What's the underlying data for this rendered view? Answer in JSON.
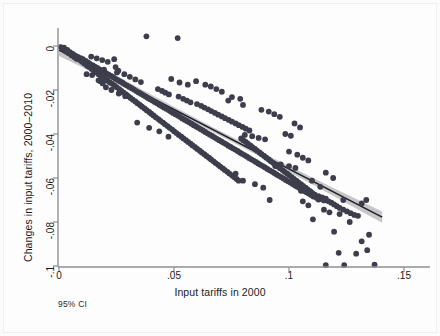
{
  "chart_data": {
    "type": "scatter",
    "title": "",
    "xlabel": "Input tariffs in 2000",
    "ylabel": "Changes in input tariffs, 2000–2010",
    "note": "95% CI",
    "grid": false,
    "legend": "none",
    "xlim": [
      0,
      0.155
    ],
    "ylim": [
      -0.1,
      0.006
    ],
    "xticks": [
      0,
      0.05,
      0.1,
      0.15
    ],
    "xticklabels": [
      "0",
      ".05",
      ".1",
      ".15"
    ],
    "yticks": [
      0,
      -0.02,
      -0.04,
      -0.06,
      -0.08,
      -0.1
    ],
    "yticklabels": [
      "0",
      "-.02",
      "-.04",
      "-.06",
      "-.08",
      "-.1"
    ],
    "marker_color": "#3d3d4c",
    "fit_line_color": "#20202c",
    "ci_band_color": "#bdbdbd",
    "axis_color": "#8f8f8f",
    "fit_line": {
      "x_start": 0.0,
      "y_start": -0.0018,
      "x_end": 0.1405,
      "y_end": -0.0778,
      "slope": -0.5409,
      "intercept": -0.0018
    },
    "ci_band": {
      "half_width_at_x_start": 0.0028,
      "half_width_at_x_mid": 0.0011,
      "half_width_at_x_end": 0.0026
    },
    "points": [
      [
        0.0008,
        -0.0005
      ],
      [
        0.0015,
        -0.0012
      ],
      [
        0.0022,
        -0.0008
      ],
      [
        0.003,
        -0.0025
      ],
      [
        0.0036,
        -0.0018
      ],
      [
        0.0042,
        -0.0033
      ],
      [
        0.0048,
        -0.0028
      ],
      [
        0.0054,
        -0.0042
      ],
      [
        0.006,
        -0.0036
      ],
      [
        0.0066,
        -0.005
      ],
      [
        0.0071,
        -0.0044
      ],
      [
        0.0076,
        -0.0058
      ],
      [
        0.0082,
        -0.0049
      ],
      [
        0.0088,
        -0.0063
      ],
      [
        0.0094,
        -0.0055
      ],
      [
        0.01,
        -0.0072
      ],
      [
        0.0104,
        -0.006
      ],
      [
        0.011,
        -0.008
      ],
      [
        0.0116,
        -0.0068
      ],
      [
        0.0122,
        -0.009
      ],
      [
        0.0126,
        -0.0074
      ],
      [
        0.0131,
        -0.0096
      ],
      [
        0.0136,
        -0.0082
      ],
      [
        0.0142,
        -0.0104
      ],
      [
        0.0147,
        -0.0088
      ],
      [
        0.0152,
        -0.0112
      ],
      [
        0.0156,
        -0.0094
      ],
      [
        0.0161,
        -0.012
      ],
      [
        0.0166,
        -0.01
      ],
      [
        0.0172,
        -0.0128
      ],
      [
        0.0176,
        -0.0106
      ],
      [
        0.0182,
        -0.0136
      ],
      [
        0.0186,
        -0.0112
      ],
      [
        0.0192,
        -0.0144
      ],
      [
        0.0196,
        -0.0118
      ],
      [
        0.0202,
        -0.015
      ],
      [
        0.0206,
        -0.0124
      ],
      [
        0.0211,
        -0.0158
      ],
      [
        0.0216,
        -0.013
      ],
      [
        0.0221,
        -0.0166
      ],
      [
        0.0172,
        -0.0156
      ],
      [
        0.018,
        -0.016
      ],
      [
        0.019,
        -0.017
      ],
      [
        0.02,
        -0.0152
      ],
      [
        0.0226,
        -0.0136
      ],
      [
        0.0231,
        -0.0172
      ],
      [
        0.0236,
        -0.0142
      ],
      [
        0.0242,
        -0.018
      ],
      [
        0.0246,
        -0.0149
      ],
      [
        0.0251,
        -0.0188
      ],
      [
        0.0256,
        -0.0155
      ],
      [
        0.0262,
        -0.0196
      ],
      [
        0.0266,
        -0.0161
      ],
      [
        0.0271,
        -0.0204
      ],
      [
        0.0276,
        -0.0167
      ],
      [
        0.0281,
        -0.0212
      ],
      [
        0.0286,
        -0.0174
      ],
      [
        0.0292,
        -0.022
      ],
      [
        0.0296,
        -0.018
      ],
      [
        0.0301,
        -0.0228
      ],
      [
        0.024,
        -0.006
      ],
      [
        0.0246,
        -0.0096
      ],
      [
        0.0252,
        -0.012
      ],
      [
        0.0258,
        -0.0112
      ],
      [
        0.0306,
        -0.0186
      ],
      [
        0.0311,
        -0.0236
      ],
      [
        0.0316,
        -0.0192
      ],
      [
        0.0321,
        -0.0244
      ],
      [
        0.0326,
        -0.0198
      ],
      [
        0.0332,
        -0.0252
      ],
      [
        0.0336,
        -0.0205
      ],
      [
        0.0341,
        -0.026
      ],
      [
        0.0346,
        -0.0211
      ],
      [
        0.0352,
        -0.0268
      ],
      [
        0.0356,
        -0.0217
      ],
      [
        0.0361,
        -0.0276
      ],
      [
        0.0366,
        -0.0223
      ],
      [
        0.0372,
        -0.0284
      ],
      [
        0.0376,
        -0.0229
      ],
      [
        0.0381,
        -0.0292
      ],
      [
        0.0386,
        -0.0236
      ],
      [
        0.0392,
        -0.03
      ],
      [
        0.0396,
        -0.0242
      ],
      [
        0.0401,
        -0.0308
      ],
      [
        0.038,
        0.0044
      ],
      [
        0.0516,
        0.0036
      ],
      [
        0.034,
        -0.0348
      ],
      [
        0.0392,
        -0.0372
      ],
      [
        0.0436,
        -0.0388
      ],
      [
        0.0476,
        -0.0412
      ],
      [
        0.0406,
        -0.0248
      ],
      [
        0.0411,
        -0.0316
      ],
      [
        0.0416,
        -0.0254
      ],
      [
        0.0421,
        -0.0324
      ],
      [
        0.0426,
        -0.026
      ],
      [
        0.0432,
        -0.0332
      ],
      [
        0.0436,
        -0.0267
      ],
      [
        0.0441,
        -0.034
      ],
      [
        0.0446,
        -0.0273
      ],
      [
        0.0452,
        -0.0348
      ],
      [
        0.0456,
        -0.0279
      ],
      [
        0.0461,
        -0.0356
      ],
      [
        0.0466,
        -0.0285
      ],
      [
        0.0472,
        -0.0364
      ],
      [
        0.0476,
        -0.0291
      ],
      [
        0.0481,
        -0.0372
      ],
      [
        0.0486,
        -0.0298
      ],
      [
        0.0492,
        -0.038
      ],
      [
        0.0496,
        -0.0304
      ],
      [
        0.0501,
        -0.0388
      ],
      [
        0.043,
        -0.0196
      ],
      [
        0.0448,
        -0.0204
      ],
      [
        0.0462,
        -0.0212
      ],
      [
        0.0478,
        -0.022
      ],
      [
        0.0506,
        -0.031
      ],
      [
        0.0511,
        -0.0396
      ],
      [
        0.0516,
        -0.0316
      ],
      [
        0.0521,
        -0.0404
      ],
      [
        0.0526,
        -0.0322
      ],
      [
        0.0532,
        -0.0412
      ],
      [
        0.0536,
        -0.0329
      ],
      [
        0.0541,
        -0.042
      ],
      [
        0.0546,
        -0.0335
      ],
      [
        0.0552,
        -0.0428
      ],
      [
        0.0556,
        -0.0341
      ],
      [
        0.0561,
        -0.0436
      ],
      [
        0.0566,
        -0.0347
      ],
      [
        0.0572,
        -0.0444
      ],
      [
        0.0576,
        -0.0353
      ],
      [
        0.0581,
        -0.0452
      ],
      [
        0.052,
        -0.023
      ],
      [
        0.054,
        -0.024
      ],
      [
        0.0556,
        -0.0248
      ],
      [
        0.0572,
        -0.0256
      ],
      [
        0.0586,
        -0.036
      ],
      [
        0.0592,
        -0.046
      ],
      [
        0.0596,
        -0.0366
      ],
      [
        0.0601,
        -0.0468
      ],
      [
        0.0606,
        -0.0372
      ],
      [
        0.0612,
        -0.0476
      ],
      [
        0.0616,
        -0.0378
      ],
      [
        0.0621,
        -0.0484
      ],
      [
        0.0626,
        -0.0384
      ],
      [
        0.0632,
        -0.0492
      ],
      [
        0.0636,
        -0.0391
      ],
      [
        0.0641,
        -0.05
      ],
      [
        0.06,
        -0.0264
      ],
      [
        0.0618,
        -0.0272
      ],
      [
        0.0632,
        -0.028
      ],
      [
        0.0648,
        -0.0288
      ],
      [
        0.0646,
        -0.0397
      ],
      [
        0.0652,
        -0.0508
      ],
      [
        0.0656,
        -0.0403
      ],
      [
        0.0661,
        -0.0516
      ],
      [
        0.0666,
        -0.0409
      ],
      [
        0.0672,
        -0.0524
      ],
      [
        0.0676,
        -0.0415
      ],
      [
        0.0681,
        -0.0532
      ],
      [
        0.0686,
        -0.0422
      ],
      [
        0.0692,
        -0.054
      ],
      [
        0.0696,
        -0.0428
      ],
      [
        0.0701,
        -0.0548
      ],
      [
        0.0662,
        -0.0296
      ],
      [
        0.0678,
        -0.0304
      ],
      [
        0.0692,
        -0.0312
      ],
      [
        0.0708,
        -0.032
      ],
      [
        0.0706,
        -0.0434
      ],
      [
        0.0712,
        -0.0556
      ],
      [
        0.0716,
        -0.044
      ],
      [
        0.0721,
        -0.0564
      ],
      [
        0.0726,
        -0.0446
      ],
      [
        0.0732,
        -0.0572
      ],
      [
        0.0736,
        -0.0453
      ],
      [
        0.0741,
        -0.058
      ],
      [
        0.0722,
        -0.0328
      ],
      [
        0.0738,
        -0.0336
      ],
      [
        0.0752,
        -0.0344
      ],
      [
        0.0768,
        -0.0352
      ],
      [
        0.0746,
        -0.0459
      ],
      [
        0.0752,
        -0.0588
      ],
      [
        0.0756,
        -0.0465
      ],
      [
        0.0761,
        -0.0596
      ],
      [
        0.0766,
        -0.0471
      ],
      [
        0.0772,
        -0.0604
      ],
      [
        0.0776,
        -0.0477
      ],
      [
        0.0781,
        -0.0612
      ],
      [
        0.0782,
        -0.036
      ],
      [
        0.0798,
        -0.0368
      ],
      [
        0.0812,
        -0.0376
      ],
      [
        0.0828,
        -0.0384
      ],
      [
        0.0786,
        -0.0484
      ],
      [
        0.0792,
        -0.042
      ],
      [
        0.0796,
        -0.049
      ],
      [
        0.0801,
        -0.0428
      ],
      [
        0.0806,
        -0.0496
      ],
      [
        0.0812,
        -0.0436
      ],
      [
        0.0816,
        -0.0502
      ],
      [
        0.0821,
        -0.0444
      ],
      [
        0.0826,
        -0.0509
      ],
      [
        0.0832,
        -0.0452
      ],
      [
        0.0836,
        -0.0515
      ],
      [
        0.0841,
        -0.046
      ],
      [
        0.0846,
        -0.0521
      ],
      [
        0.0852,
        -0.0468
      ],
      [
        0.0856,
        -0.0527
      ],
      [
        0.0861,
        -0.0476
      ],
      [
        0.0866,
        -0.0534
      ],
      [
        0.0872,
        -0.0484
      ],
      [
        0.0876,
        -0.054
      ],
      [
        0.0881,
        -0.0492
      ],
      [
        0.0886,
        -0.0546
      ],
      [
        0.0892,
        -0.05
      ],
      [
        0.0896,
        -0.0552
      ],
      [
        0.0901,
        -0.0508
      ],
      [
        0.0906,
        -0.0559
      ],
      [
        0.0912,
        -0.0516
      ],
      [
        0.0916,
        -0.0565
      ],
      [
        0.0921,
        -0.0524
      ],
      [
        0.0926,
        -0.0571
      ],
      [
        0.0932,
        -0.0532
      ],
      [
        0.0936,
        -0.0577
      ],
      [
        0.0941,
        -0.054
      ],
      [
        0.0946,
        -0.0584
      ],
      [
        0.0952,
        -0.0548
      ],
      [
        0.0956,
        -0.059
      ],
      [
        0.0961,
        -0.0556
      ],
      [
        0.0966,
        -0.0596
      ],
      [
        0.0972,
        -0.0564
      ],
      [
        0.0976,
        -0.0602
      ],
      [
        0.0981,
        -0.0572
      ],
      [
        0.0986,
        -0.0609
      ],
      [
        0.0992,
        -0.058
      ],
      [
        0.0996,
        -0.0615
      ],
      [
        0.1001,
        -0.0588
      ],
      [
        0.1006,
        -0.0621
      ],
      [
        0.1012,
        -0.0596
      ],
      [
        0.1016,
        -0.0627
      ],
      [
        0.1021,
        -0.0604
      ],
      [
        0.1026,
        -0.0634
      ],
      [
        0.1032,
        -0.0612
      ],
      [
        0.1036,
        -0.064
      ],
      [
        0.1041,
        -0.062
      ],
      [
        0.1046,
        -0.0646
      ],
      [
        0.1052,
        -0.0628
      ],
      [
        0.1056,
        -0.0652
      ],
      [
        0.1061,
        -0.0636
      ],
      [
        0.1066,
        -0.0659
      ],
      [
        0.1072,
        -0.0644
      ],
      [
        0.1076,
        -0.0665
      ],
      [
        0.1081,
        -0.0652
      ],
      [
        0.1086,
        -0.0671
      ],
      [
        0.1092,
        -0.066
      ],
      [
        0.1096,
        -0.0677
      ],
      [
        0.1101,
        -0.0668
      ],
      [
        0.1106,
        -0.0684
      ],
      [
        0.1112,
        -0.0676
      ],
      [
        0.112,
        -0.069
      ],
      [
        0.1128,
        -0.0682
      ],
      [
        0.1136,
        -0.0696
      ],
      [
        0.1144,
        -0.0688
      ],
      [
        0.1152,
        -0.0702
      ],
      [
        0.116,
        -0.0694
      ],
      [
        0.1172,
        -0.0706
      ],
      [
        0.1184,
        -0.0712
      ],
      [
        0.1196,
        -0.072
      ],
      [
        0.1208,
        -0.0728
      ],
      [
        0.122,
        -0.0736
      ],
      [
        0.1236,
        -0.0744
      ],
      [
        0.1252,
        -0.0752
      ],
      [
        0.1268,
        -0.076
      ],
      [
        0.1284,
        -0.0768
      ],
      [
        0.13,
        -0.0772
      ],
      [
        0.1316,
        -0.0716
      ],
      [
        0.1336,
        -0.07
      ],
      [
        0.088,
        -0.029
      ],
      [
        0.0912,
        -0.0298
      ],
      [
        0.0936,
        -0.031
      ],
      [
        0.096,
        -0.0322
      ],
      [
        0.0808,
        -0.0404
      ],
      [
        0.084,
        -0.041
      ],
      [
        0.0868,
        -0.0418
      ],
      [
        0.0896,
        -0.0424
      ],
      [
        0.0984,
        -0.04
      ],
      [
        0.1008,
        -0.0408
      ],
      [
        0.1024,
        -0.0352
      ],
      [
        0.1048,
        -0.037
      ],
      [
        0.0736,
        -0.0248
      ],
      [
        0.0752,
        -0.0232
      ],
      [
        0.0788,
        -0.024
      ],
      [
        0.08,
        -0.0268
      ],
      [
        0.1,
        -0.048
      ],
      [
        0.1036,
        -0.0494
      ],
      [
        0.106,
        -0.0508
      ],
      [
        0.1084,
        -0.052
      ],
      [
        0.0768,
        -0.058
      ],
      [
        0.08,
        -0.0612
      ],
      [
        0.0852,
        -0.0628
      ],
      [
        0.0888,
        -0.0644
      ],
      [
        0.0916,
        -0.07
      ],
      [
        0.1052,
        -0.0658
      ],
      [
        0.106,
        -0.0706
      ],
      [
        0.1084,
        -0.0724
      ],
      [
        0.1104,
        -0.0788
      ],
      [
        0.1128,
        -0.0698
      ],
      [
        0.1152,
        -0.0744
      ],
      [
        0.1176,
        -0.0756
      ],
      [
        0.1196,
        -0.0844
      ],
      [
        0.122,
        -0.0764
      ],
      [
        0.1236,
        -0.07
      ],
      [
        0.1264,
        -0.08
      ],
      [
        0.1216,
        -0.094
      ],
      [
        0.124,
        -0.0996
      ],
      [
        0.1316,
        -0.0888
      ],
      [
        0.134,
        -0.0928
      ],
      [
        0.1348,
        -0.0858
      ],
      [
        0.1372,
        -0.0994
      ],
      [
        0.1292,
        -0.0944
      ],
      [
        0.116,
        -0.0996
      ],
      [
        0.11,
        -0.0612
      ],
      [
        0.1136,
        -0.064
      ],
      [
        0.116,
        -0.0576
      ],
      [
        0.1192,
        -0.06
      ],
      [
        0.1,
        -0.0546
      ],
      [
        0.1028,
        -0.0554
      ],
      [
        0.0964,
        -0.0538
      ],
      [
        0.094,
        -0.0546
      ],
      [
        0.0684,
        -0.0196
      ],
      [
        0.0708,
        -0.0208
      ],
      [
        0.066,
        -0.0184
      ],
      [
        0.0636,
        -0.0176
      ],
      [
        0.0596,
        -0.016
      ],
      [
        0.056,
        -0.0176
      ],
      [
        0.0524,
        -0.0166
      ],
      [
        0.0488,
        -0.015
      ],
      [
        0.0284,
        -0.0128
      ],
      [
        0.0308,
        -0.014
      ],
      [
        0.0332,
        -0.0152
      ],
      [
        0.0356,
        -0.0164
      ],
      [
        0.014,
        -0.0048
      ],
      [
        0.0164,
        -0.0056
      ],
      [
        0.0188,
        -0.0064
      ],
      [
        0.0212,
        -0.0072
      ],
      [
        0.012,
        -0.0128
      ],
      [
        0.0144,
        -0.0132
      ],
      [
        0.0168,
        -0.0116
      ],
      [
        0.0196,
        -0.0108
      ],
      [
        0.026,
        -0.0216
      ],
      [
        0.0288,
        -0.0228
      ],
      [
        0.0228,
        -0.02
      ],
      [
        0.0204,
        -0.0188
      ]
    ]
  }
}
